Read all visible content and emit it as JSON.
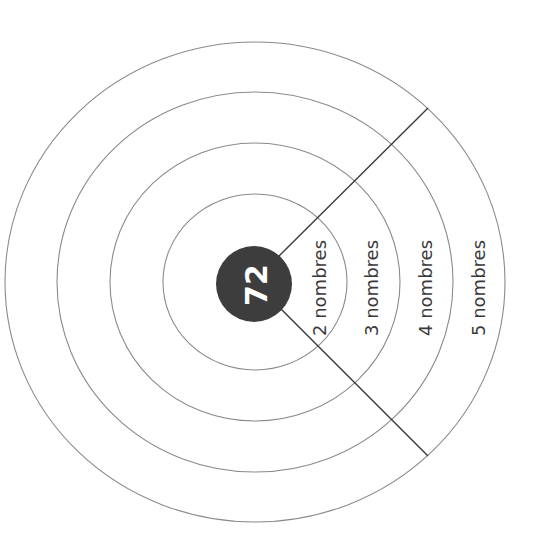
{
  "diagram": {
    "center_value": "72",
    "rings": [
      {
        "label": "2 nombres"
      },
      {
        "label": "3 nombres"
      },
      {
        "label": "4 nombres"
      },
      {
        "label": "5 nombres"
      }
    ],
    "colors": {
      "disc": "#3d3d3d",
      "ring_stroke": "#8a8a8a",
      "divider": "#3a3a3a",
      "text": "#3a3a3a"
    }
  }
}
